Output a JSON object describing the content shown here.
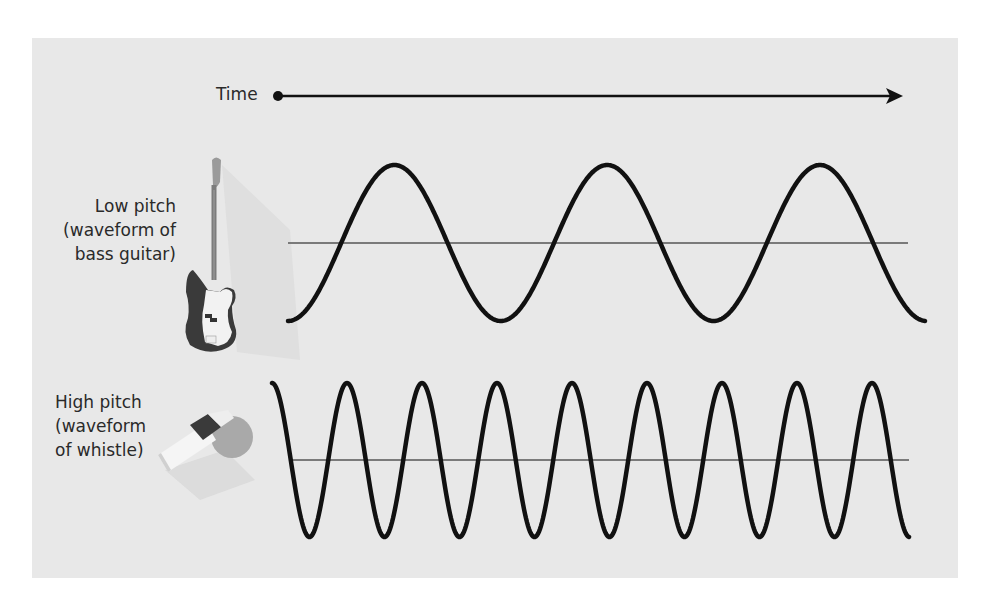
{
  "diagram": {
    "time_axis": {
      "label": "Time",
      "arrow_color": "#111111"
    },
    "low_pitch": {
      "label_lines": [
        "Low pitch",
        "(waveform of",
        "bass guitar)"
      ],
      "instrument_icon": "bass-guitar-icon",
      "waveform": {
        "cycles": 3,
        "center_y": 243,
        "amplitude": 78,
        "period_px": 212.8,
        "x_start": 288,
        "x_end": 925
      }
    },
    "high_pitch": {
      "label_lines": [
        "High pitch",
        "(waveform",
        "of whistle)"
      ],
      "instrument_icon": "whistle-icon",
      "waveform": {
        "cycles": 8.5,
        "center_y": 460,
        "amplitude": 77,
        "period_px": 75,
        "x_start": 272,
        "x_end": 909
      }
    },
    "colors": {
      "panel_bg": "#e8e8e8",
      "wave": "#111111",
      "center_line": "#7a7a7a",
      "text": "#2a2a2a"
    }
  }
}
